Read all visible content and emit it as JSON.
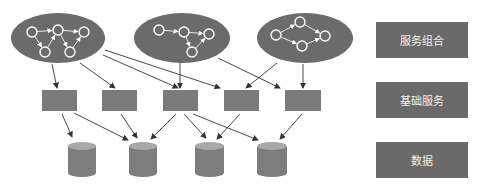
{
  "legend": [
    {
      "label": "服务组合",
      "top": 22
    },
    {
      "label": "基础服务",
      "top": 82
    },
    {
      "label": "数据",
      "top": 142
    }
  ],
  "colors": {
    "ellipse": "#6b6b6b",
    "rect": "#7a7a7a",
    "cylinder_body": "#7d7d7d",
    "cylinder_top": "#a8a8a8",
    "node": "#ffffff",
    "arrow": "#333333",
    "legend_bg": "#6a6a6a"
  },
  "layers": {
    "composition": {
      "ellipses": [
        {
          "cx": 58,
          "cy": 38,
          "rx": 47,
          "ry": 25,
          "nodes": [
            [
              32,
              32
            ],
            [
              58,
              30
            ],
            [
              84,
              32
            ],
            [
              45,
              52
            ],
            [
              70,
              52
            ]
          ],
          "edges": [
            [
              0,
              1
            ],
            [
              1,
              2
            ],
            [
              0,
              3
            ],
            [
              3,
              1
            ],
            [
              1,
              4
            ],
            [
              4,
              2
            ]
          ]
        },
        {
          "cx": 182,
          "cy": 38,
          "rx": 48,
          "ry": 25,
          "nodes": [
            [
              159,
              30
            ],
            [
              184,
              32
            ],
            [
              209,
              34
            ],
            [
              192,
              52
            ]
          ],
          "edges": [
            [
              0,
              1
            ],
            [
              1,
              2
            ],
            [
              1,
              3
            ],
            [
              3,
              2
            ]
          ]
        },
        {
          "cx": 305,
          "cy": 38,
          "rx": 48,
          "ry": 25,
          "nodes": [
            [
              276,
              35
            ],
            [
              300,
              22
            ],
            [
              325,
              36
            ],
            [
              302,
              46
            ]
          ],
          "edges": [
            [
              0,
              1
            ],
            [
              1,
              2
            ],
            [
              0,
              3
            ],
            [
              3,
              2
            ]
          ]
        }
      ]
    },
    "services": {
      "rects": [
        {
          "x": 42,
          "y": 90,
          "w": 35,
          "h": 21
        },
        {
          "x": 102,
          "y": 90,
          "w": 35,
          "h": 21
        },
        {
          "x": 163,
          "y": 90,
          "w": 35,
          "h": 21
        },
        {
          "x": 224,
          "y": 90,
          "w": 35,
          "h": 21
        },
        {
          "x": 285,
          "y": 90,
          "w": 36,
          "h": 21
        }
      ]
    },
    "data": {
      "cylinders": [
        {
          "x": 68,
          "y": 142,
          "w": 28,
          "h": 35
        },
        {
          "x": 129,
          "y": 142,
          "w": 28,
          "h": 35
        },
        {
          "x": 195,
          "y": 142,
          "w": 29,
          "h": 35
        },
        {
          "x": 257,
          "y": 142,
          "w": 30,
          "h": 35
        }
      ]
    }
  },
  "arrows": [
    [
      52,
      64,
      57,
      88
    ],
    [
      80,
      63,
      115,
      88
    ],
    [
      103,
      55,
      178,
      88
    ],
    [
      105,
      50,
      220,
      88
    ],
    [
      180,
      62,
      180,
      88
    ],
    [
      218,
      58,
      280,
      88
    ],
    [
      277,
      63,
      246,
      88
    ],
    [
      303,
      64,
      303,
      88
    ],
    [
      62,
      114,
      72,
      137
    ],
    [
      74,
      113,
      128,
      140
    ],
    [
      121,
      114,
      137,
      138
    ],
    [
      176,
      114,
      151,
      139
    ],
    [
      184,
      114,
      206,
      138
    ],
    [
      193,
      114,
      258,
      140
    ],
    [
      240,
      114,
      217,
      139
    ],
    [
      302,
      114,
      280,
      139
    ]
  ]
}
